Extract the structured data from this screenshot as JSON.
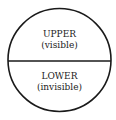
{
  "diagram": {
    "shape": "circle-divided-horizontally",
    "stroke_color": "#1a1a1a",
    "background": "#ffffff",
    "upper": {
      "title": "UPPER",
      "subtitle": "(visible)"
    },
    "lower": {
      "title": "LOWER",
      "subtitle": "(invisible)"
    }
  }
}
